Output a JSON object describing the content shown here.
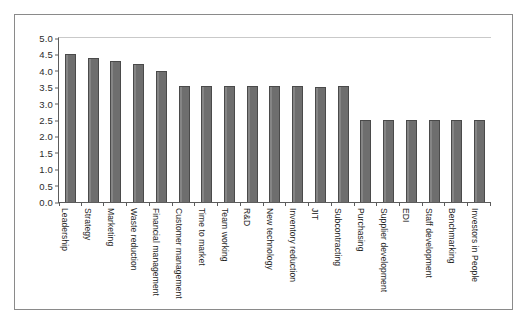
{
  "chart_data": {
    "type": "bar",
    "title": "",
    "xlabel": "",
    "ylabel": "",
    "ylim": [
      0.0,
      5.0
    ],
    "y_ticks": [
      "0.0",
      "0.5",
      "1.0",
      "1.5",
      "2.0",
      "2.5",
      "3.0",
      "3.5",
      "4.0",
      "4.5",
      "5.0"
    ],
    "grid": false,
    "legend": null,
    "bar_color": "#6e6e6e",
    "bar_edge_color": "#4a4a4a",
    "categories": [
      "Leadership",
      "Strategy",
      "Marketing",
      "Waste reduction",
      "Financial management",
      "Customer management",
      "Time to market",
      "Team working",
      "R&D",
      "New technology",
      "Inventory reduction",
      "JIT",
      "Subcontracting",
      "Purchasing",
      "Supplier development",
      "EDI",
      "Staff development",
      "Benchmarking",
      "Investors in People"
    ],
    "values": [
      4.5,
      4.4,
      4.3,
      4.2,
      4.0,
      3.55,
      3.55,
      3.55,
      3.55,
      3.55,
      3.55,
      3.5,
      3.55,
      2.5,
      2.5,
      2.5,
      2.5,
      2.5,
      2.5
    ]
  }
}
